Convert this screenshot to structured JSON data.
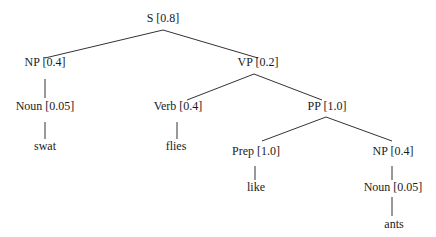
{
  "diagram": {
    "type": "parse-tree",
    "nodes": [
      {
        "id": "s",
        "label": "S [0.8]",
        "x": 163,
        "y": 22
      },
      {
        "id": "np1",
        "label": "NP [0.4]",
        "x": 45,
        "y": 66
      },
      {
        "id": "vp",
        "label": "VP [0.2]",
        "x": 258,
        "y": 66
      },
      {
        "id": "noun1",
        "label": "Noun [0.05]",
        "x": 45,
        "y": 110
      },
      {
        "id": "verb",
        "label": "Verb [0.4]",
        "x": 178,
        "y": 110
      },
      {
        "id": "pp",
        "label": "PP [1.0]",
        "x": 327,
        "y": 110
      },
      {
        "id": "swat",
        "label": "swat",
        "x": 45,
        "y": 150
      },
      {
        "id": "flies",
        "label": "flies",
        "x": 176,
        "y": 150
      },
      {
        "id": "prep",
        "label": "Prep [1.0]",
        "x": 256,
        "y": 155
      },
      {
        "id": "np2",
        "label": "NP [0.4]",
        "x": 393,
        "y": 155
      },
      {
        "id": "like",
        "label": "like",
        "x": 256,
        "y": 191
      },
      {
        "id": "noun2",
        "label": "Noun [0.05]",
        "x": 393,
        "y": 191
      },
      {
        "id": "ants",
        "label": "ants",
        "x": 394,
        "y": 228
      }
    ],
    "edges": [
      {
        "from": "s",
        "to": "np1",
        "x1": 163,
        "y1": 30,
        "x2": 45,
        "y2": 58
      },
      {
        "from": "s",
        "to": "vp",
        "x1": 163,
        "y1": 30,
        "x2": 258,
        "y2": 58
      },
      {
        "from": "np1",
        "to": "noun1",
        "x1": 45,
        "y1": 79,
        "x2": 45,
        "y2": 98
      },
      {
        "from": "vp",
        "to": "verb",
        "x1": 254,
        "y1": 74,
        "x2": 187,
        "y2": 100
      },
      {
        "from": "vp",
        "to": "pp",
        "x1": 254,
        "y1": 74,
        "x2": 322,
        "y2": 100
      },
      {
        "from": "noun1",
        "to": "swat",
        "x1": 45,
        "y1": 122,
        "x2": 45,
        "y2": 139
      },
      {
        "from": "verb",
        "to": "flies",
        "x1": 177,
        "y1": 122,
        "x2": 177,
        "y2": 139
      },
      {
        "from": "pp",
        "to": "prep",
        "x1": 326,
        "y1": 117,
        "x2": 262,
        "y2": 141
      },
      {
        "from": "pp",
        "to": "np2",
        "x1": 326,
        "y1": 117,
        "x2": 392,
        "y2": 141
      },
      {
        "from": "prep",
        "to": "like",
        "x1": 255,
        "y1": 166,
        "x2": 255,
        "y2": 180
      },
      {
        "from": "np2",
        "to": "noun2",
        "x1": 392,
        "y1": 166,
        "x2": 392,
        "y2": 180
      },
      {
        "from": "noun2",
        "to": "ants",
        "x1": 392,
        "y1": 197,
        "x2": 392,
        "y2": 216
      }
    ]
  }
}
